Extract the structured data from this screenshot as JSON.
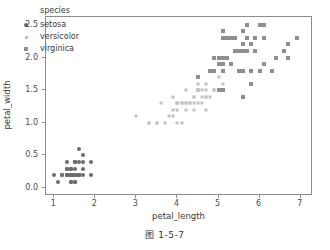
{
  "caption": "图 1-5-7",
  "legend": {
    "title": "species",
    "entries": [
      {
        "label": "setosa",
        "marker": "circle-marker",
        "color": "#6b6b6b"
      },
      {
        "label": "versicolor",
        "marker": "small-square-marker",
        "color": "#c2c2c2"
      },
      {
        "label": "virginica",
        "marker": "square-marker",
        "color": "#8f8f8f"
      }
    ]
  },
  "chart_data": {
    "type": "scatter",
    "title": "",
    "xlabel": "petal_length",
    "ylabel": "petal_width",
    "xlim": [
      0.8,
      7.3
    ],
    "ylim": [
      -0.12,
      2.62
    ],
    "xticks": [
      1,
      2,
      3,
      4,
      5,
      6,
      7
    ],
    "xticklabels": [
      "1",
      "2",
      "3",
      "4",
      "5",
      "6",
      "7"
    ],
    "yticks": [
      0.0,
      0.5,
      1.0,
      1.5,
      2.0,
      2.5
    ],
    "yticklabels": [
      "0.0",
      "0.5",
      "1.0",
      "1.5",
      "2.0",
      "2.5"
    ],
    "grid": false,
    "legend_position": "upper left",
    "legend_title": "species",
    "series": [
      {
        "name": "setosa",
        "color": "#6b6b6b",
        "marker": "circle",
        "points": [
          [
            1.4,
            0.2
          ],
          [
            1.4,
            0.2
          ],
          [
            1.3,
            0.2
          ],
          [
            1.5,
            0.2
          ],
          [
            1.4,
            0.2
          ],
          [
            1.7,
            0.4
          ],
          [
            1.4,
            0.3
          ],
          [
            1.5,
            0.2
          ],
          [
            1.4,
            0.2
          ],
          [
            1.5,
            0.1
          ],
          [
            1.5,
            0.2
          ],
          [
            1.6,
            0.2
          ],
          [
            1.4,
            0.1
          ],
          [
            1.1,
            0.1
          ],
          [
            1.2,
            0.2
          ],
          [
            1.5,
            0.4
          ],
          [
            1.3,
            0.4
          ],
          [
            1.4,
            0.3
          ],
          [
            1.7,
            0.3
          ],
          [
            1.5,
            0.3
          ],
          [
            1.7,
            0.2
          ],
          [
            1.5,
            0.4
          ],
          [
            1.0,
            0.2
          ],
          [
            1.7,
            0.5
          ],
          [
            1.9,
            0.2
          ],
          [
            1.6,
            0.2
          ],
          [
            1.6,
            0.4
          ],
          [
            1.5,
            0.2
          ],
          [
            1.4,
            0.2
          ],
          [
            1.6,
            0.2
          ],
          [
            1.6,
            0.2
          ],
          [
            1.5,
            0.4
          ],
          [
            1.5,
            0.1
          ],
          [
            1.4,
            0.2
          ],
          [
            1.5,
            0.2
          ],
          [
            1.2,
            0.2
          ],
          [
            1.3,
            0.2
          ],
          [
            1.4,
            0.1
          ],
          [
            1.3,
            0.2
          ],
          [
            1.5,
            0.2
          ],
          [
            1.3,
            0.3
          ],
          [
            1.3,
            0.3
          ],
          [
            1.3,
            0.2
          ],
          [
            1.6,
            0.6
          ],
          [
            1.9,
            0.4
          ],
          [
            1.4,
            0.3
          ],
          [
            1.6,
            0.2
          ],
          [
            1.4,
            0.2
          ],
          [
            1.5,
            0.2
          ],
          [
            1.4,
            0.2
          ]
        ]
      },
      {
        "name": "versicolor",
        "color": "#c2c2c2",
        "marker": "square",
        "points": [
          [
            4.7,
            1.4
          ],
          [
            4.5,
            1.5
          ],
          [
            4.9,
            1.5
          ],
          [
            4.0,
            1.3
          ],
          [
            4.6,
            1.5
          ],
          [
            4.5,
            1.3
          ],
          [
            4.7,
            1.6
          ],
          [
            3.3,
            1.0
          ],
          [
            4.6,
            1.3
          ],
          [
            3.9,
            1.4
          ],
          [
            3.5,
            1.0
          ],
          [
            4.2,
            1.5
          ],
          [
            4.0,
            1.0
          ],
          [
            4.7,
            1.4
          ],
          [
            3.6,
            1.3
          ],
          [
            4.4,
            1.4
          ],
          [
            4.5,
            1.5
          ],
          [
            4.1,
            1.0
          ],
          [
            4.5,
            1.5
          ],
          [
            3.9,
            1.1
          ],
          [
            4.8,
            1.8
          ],
          [
            4.0,
            1.3
          ],
          [
            4.9,
            1.5
          ],
          [
            4.7,
            1.2
          ],
          [
            4.3,
            1.3
          ],
          [
            4.4,
            1.4
          ],
          [
            4.8,
            1.4
          ],
          [
            5.0,
            1.7
          ],
          [
            4.5,
            1.5
          ],
          [
            3.5,
            1.0
          ],
          [
            3.8,
            1.1
          ],
          [
            3.7,
            1.0
          ],
          [
            3.9,
            1.2
          ],
          [
            5.1,
            1.6
          ],
          [
            4.5,
            1.5
          ],
          [
            4.5,
            1.6
          ],
          [
            4.7,
            1.5
          ],
          [
            4.4,
            1.3
          ],
          [
            4.1,
            1.3
          ],
          [
            4.0,
            1.3
          ],
          [
            4.4,
            1.2
          ],
          [
            4.6,
            1.4
          ],
          [
            4.0,
            1.2
          ],
          [
            3.3,
            1.0
          ],
          [
            4.2,
            1.3
          ],
          [
            4.2,
            1.2
          ],
          [
            4.2,
            1.3
          ],
          [
            4.3,
            1.3
          ],
          [
            3.0,
            1.1
          ],
          [
            4.1,
            1.3
          ]
        ]
      },
      {
        "name": "virginica",
        "color": "#8f8f8f",
        "marker": "square",
        "points": [
          [
            6.0,
            2.5
          ],
          [
            5.1,
            1.9
          ],
          [
            5.9,
            2.1
          ],
          [
            5.6,
            1.8
          ],
          [
            5.8,
            2.2
          ],
          [
            6.6,
            2.1
          ],
          [
            4.5,
            1.7
          ],
          [
            6.3,
            1.8
          ],
          [
            5.8,
            1.8
          ],
          [
            6.1,
            2.5
          ],
          [
            5.1,
            2.0
          ],
          [
            5.3,
            1.9
          ],
          [
            5.5,
            2.1
          ],
          [
            5.0,
            2.0
          ],
          [
            5.1,
            2.4
          ],
          [
            5.3,
            2.3
          ],
          [
            5.5,
            1.8
          ],
          [
            6.7,
            2.2
          ],
          [
            6.9,
            2.3
          ],
          [
            5.0,
            1.5
          ],
          [
            5.7,
            2.3
          ],
          [
            4.9,
            2.0
          ],
          [
            6.7,
            2.0
          ],
          [
            4.9,
            1.8
          ],
          [
            5.7,
            2.1
          ],
          [
            6.0,
            1.8
          ],
          [
            4.8,
            1.8
          ],
          [
            4.9,
            1.8
          ],
          [
            5.6,
            2.1
          ],
          [
            5.8,
            1.6
          ],
          [
            6.1,
            1.9
          ],
          [
            6.4,
            2.0
          ],
          [
            5.6,
            2.2
          ],
          [
            5.1,
            1.5
          ],
          [
            5.6,
            1.4
          ],
          [
            6.1,
            2.3
          ],
          [
            5.6,
            2.4
          ],
          [
            5.5,
            1.8
          ],
          [
            4.8,
            1.8
          ],
          [
            5.4,
            2.1
          ],
          [
            5.6,
            2.4
          ],
          [
            5.1,
            2.3
          ],
          [
            5.1,
            1.9
          ],
          [
            5.9,
            2.3
          ],
          [
            5.7,
            2.5
          ],
          [
            5.2,
            2.3
          ],
          [
            5.0,
            1.9
          ],
          [
            5.2,
            2.0
          ],
          [
            5.4,
            2.3
          ],
          [
            5.1,
            1.8
          ]
        ]
      }
    ]
  }
}
